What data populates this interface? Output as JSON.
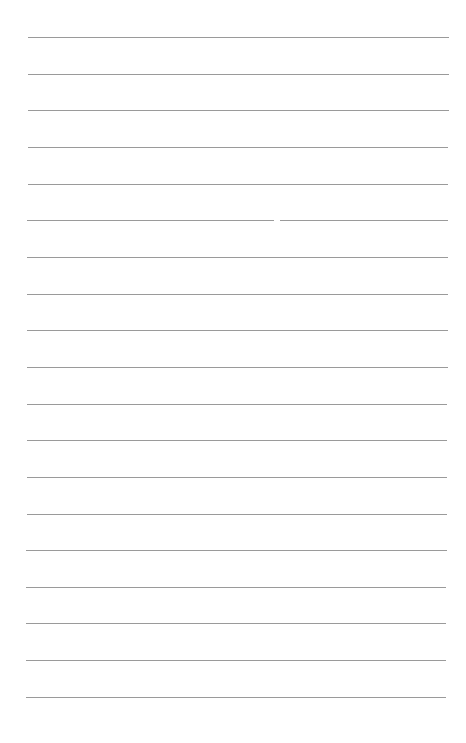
{
  "page": {
    "type": "lined-paper",
    "background": "#ffffff",
    "rule_color": "#9a9a9a",
    "rule_count": 19,
    "rules_y": [
      37,
      74,
      110,
      147,
      184,
      220,
      257,
      294,
      330,
      367,
      404,
      440,
      477,
      514,
      550,
      587,
      623,
      660,
      697
    ],
    "rule_x_start": 28,
    "rule_x_end": 449
  }
}
